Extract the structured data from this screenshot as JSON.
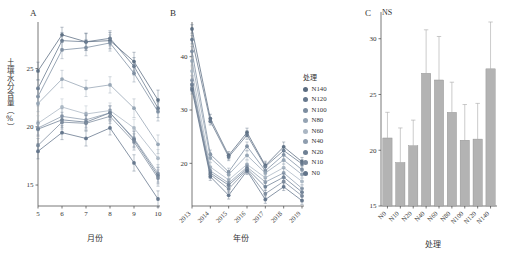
{
  "figure": {
    "width": 505,
    "height": 261,
    "background": "#ffffff"
  },
  "legend": {
    "title": "处理",
    "items": [
      {
        "label": "N140",
        "color": "#5a6b80"
      },
      {
        "label": "N120",
        "color": "#66788d"
      },
      {
        "label": "N100",
        "color": "#7c8da0"
      },
      {
        "label": "N80",
        "color": "#94a3b3"
      },
      {
        "label": "N60",
        "color": "#aab6c3"
      },
      {
        "label": "N40",
        "color": "#8e9dae"
      },
      {
        "label": "N20",
        "color": "#6e8094"
      },
      {
        "label": "N10",
        "color": "#7b8a9c"
      },
      {
        "label": "N0",
        "color": "#62748a"
      }
    ]
  },
  "chart_data": [
    {
      "type": "line",
      "panel": "A",
      "title": "A",
      "xlabel": "月份",
      "ylabel": "土壤水分含量（%）",
      "categories": [
        "5",
        "6",
        "7",
        "8",
        "9",
        "10"
      ],
      "xticklabels": [
        "5",
        "6",
        "7",
        "8",
        "9",
        "10"
      ],
      "yticks": [
        15,
        20,
        25
      ],
      "ylim": [
        13.2,
        29.0
      ],
      "grid": false,
      "series": [
        {
          "name": "N140",
          "color": "#5a6b80",
          "values": [
            24.8,
            27.9,
            27.3,
            27.4,
            25.6,
            22.3
          ],
          "errors": [
            0.75,
            0.65,
            0.75,
            0.7,
            0.8,
            0.85
          ]
        },
        {
          "name": "N120",
          "color": "#66788d",
          "values": [
            23.3,
            27.4,
            27.3,
            27.6,
            25.2,
            21.6
          ],
          "errors": [
            0.7,
            0.7,
            0.7,
            0.65,
            0.75,
            0.8
          ]
        },
        {
          "name": "N100",
          "color": "#7c8da0",
          "values": [
            22.6,
            26.6,
            26.8,
            27.2,
            24.6,
            21.3
          ],
          "errors": [
            0.8,
            0.75,
            0.7,
            0.7,
            0.75,
            0.8
          ]
        },
        {
          "name": "N80",
          "color": "#94a3b3",
          "values": [
            22.0,
            24.1,
            23.3,
            23.6,
            21.6,
            18.5
          ],
          "errors": [
            0.7,
            0.75,
            0.7,
            0.7,
            0.8,
            0.8
          ]
        },
        {
          "name": "N60",
          "color": "#aab6c3",
          "values": [
            20.3,
            21.7,
            21.1,
            21.4,
            19.9,
            17.3
          ],
          "errors": [
            0.65,
            0.7,
            0.7,
            0.65,
            0.75,
            0.75
          ]
        },
        {
          "name": "N40",
          "color": "#8e9dae",
          "values": [
            19.9,
            20.9,
            20.6,
            21.2,
            19.0,
            16.0
          ],
          "errors": [
            0.6,
            0.65,
            0.65,
            0.6,
            0.7,
            0.75
          ]
        },
        {
          "name": "N20",
          "color": "#6e8094",
          "values": [
            19.8,
            20.6,
            20.4,
            21.2,
            18.9,
            15.8
          ],
          "errors": [
            0.6,
            0.65,
            0.6,
            0.6,
            0.7,
            0.7
          ]
        },
        {
          "name": "N10",
          "color": "#7b8a9c",
          "values": [
            18.4,
            20.4,
            20.3,
            20.9,
            18.7,
            15.6
          ],
          "errors": [
            0.6,
            0.6,
            0.65,
            0.6,
            0.7,
            0.7
          ]
        },
        {
          "name": "N0",
          "color": "#62748a",
          "values": [
            17.9,
            19.5,
            19.0,
            19.9,
            16.9,
            13.8
          ],
          "errors": [
            0.65,
            0.6,
            0.65,
            0.6,
            0.7,
            0.7
          ]
        }
      ]
    },
    {
      "type": "line",
      "panel": "B",
      "title": "B",
      "xlabel": "年份",
      "ylabel": "",
      "categories": [
        "2013",
        "2014",
        "2015",
        "2016",
        "2017",
        "2018",
        "2019"
      ],
      "xticklabels": [
        "2013",
        "2014",
        "2015",
        "2016",
        "2017",
        "2018",
        "2019"
      ],
      "yticks": [
        20,
        30,
        40
      ],
      "ylim": [
        12.0,
        46.5
      ],
      "grid": false,
      "series": [
        {
          "name": "N140",
          "color": "#5a6b80",
          "values": [
            45.2,
            28.4,
            21.5,
            25.8,
            19.6,
            23.1,
            20.3
          ],
          "errors": [
            0.8,
            0.8,
            0.7,
            0.8,
            0.8,
            0.9,
            0.8
          ]
        },
        {
          "name": "N120",
          "color": "#66788d",
          "values": [
            43.2,
            27.9,
            21.2,
            25.3,
            19.4,
            22.4,
            19.9
          ],
          "errors": [
            0.8,
            0.7,
            0.7,
            0.8,
            0.7,
            0.8,
            0.8
          ]
        },
        {
          "name": "N100",
          "color": "#7c8da0",
          "values": [
            41.0,
            21.7,
            18.4,
            23.2,
            18.6,
            21.6,
            18.8
          ],
          "errors": [
            0.9,
            0.8,
            0.7,
            0.8,
            0.8,
            0.8,
            0.8
          ]
        },
        {
          "name": "N80",
          "color": "#94a3b3",
          "values": [
            39.2,
            21.0,
            17.9,
            21.5,
            18.2,
            20.6,
            17.9
          ],
          "errors": [
            0.8,
            0.8,
            0.7,
            0.8,
            0.7,
            0.8,
            0.7
          ]
        },
        {
          "name": "N60",
          "color": "#aab6c3",
          "values": [
            37.3,
            19.3,
            16.9,
            19.8,
            17.3,
            19.2,
            16.6
          ],
          "errors": [
            0.8,
            0.8,
            0.7,
            0.7,
            0.7,
            0.8,
            0.7
          ]
        },
        {
          "name": "N40",
          "color": "#8e9dae",
          "values": [
            35.6,
            18.6,
            16.3,
            19.3,
            16.5,
            18.2,
            15.3
          ],
          "errors": [
            0.8,
            0.7,
            0.7,
            0.7,
            0.7,
            0.8,
            0.7
          ]
        },
        {
          "name": "N20",
          "color": "#6e8094",
          "values": [
            34.8,
            18.2,
            15.9,
            19.0,
            15.6,
            17.4,
            14.6
          ],
          "errors": [
            0.8,
            0.7,
            0.7,
            0.7,
            0.7,
            0.7,
            0.7
          ]
        },
        {
          "name": "N10",
          "color": "#7b8a9c",
          "values": [
            34.2,
            17.9,
            15.2,
            18.8,
            14.3,
            16.6,
            13.9
          ],
          "errors": [
            0.8,
            0.7,
            0.7,
            0.7,
            0.7,
            0.7,
            0.7
          ]
        },
        {
          "name": "N0",
          "color": "#62748a",
          "values": [
            33.8,
            17.5,
            14.0,
            18.6,
            13.2,
            15.6,
            13.0
          ],
          "errors": [
            0.8,
            0.7,
            0.7,
            0.7,
            0.7,
            0.7,
            0.7
          ]
        }
      ]
    },
    {
      "type": "bar",
      "panel": "C",
      "title": "C",
      "annotation": "NS",
      "xlabel": "处理",
      "ylabel": "",
      "categories": [
        "N0",
        "N10",
        "N20",
        "N40",
        "N60",
        "N80",
        "N100",
        "N120",
        "N140"
      ],
      "values": [
        21.1,
        18.9,
        20.4,
        26.9,
        26.3,
        23.4,
        20.9,
        21.0,
        27.3
      ],
      "errors": [
        2.3,
        3.1,
        2.3,
        3.9,
        3.9,
        2.7,
        3.2,
        3.2,
        4.2
      ],
      "yticks": [
        15,
        20,
        25,
        30
      ],
      "ylim": [
        15.0,
        31.5
      ],
      "bar_color": "#b3b3b3",
      "bar_edge": "#8c8c8c",
      "grid": false
    }
  ]
}
